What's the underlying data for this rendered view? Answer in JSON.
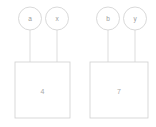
{
  "diagram": {
    "type": "node-plate-diagram",
    "background_color": "#ffffff",
    "stroke_color": "#cfcfcf",
    "text_color": "#9a9a9a",
    "groups": [
      {
        "id": "left-group",
        "nodes": [
          {
            "id": "node-a",
            "label": "a",
            "cx": 30,
            "cy": 18.5,
            "r": 11.5
          },
          {
            "id": "node-x",
            "label": "x",
            "cx": 57,
            "cy": 18.5,
            "r": 11.5
          }
        ],
        "edges": [
          {
            "id": "edge-a-box",
            "from": "node-a",
            "to": "box-4",
            "x": 30,
            "y1": 30,
            "y2": 62
          },
          {
            "id": "edge-x-box",
            "from": "node-x",
            "to": "box-4",
            "x": 57,
            "y1": 30,
            "y2": 62
          }
        ],
        "plate": {
          "id": "box-4",
          "label": "4",
          "x": 15,
          "y": 62,
          "width": 55,
          "height": 56
        }
      },
      {
        "id": "right-group",
        "nodes": [
          {
            "id": "node-b",
            "label": "b",
            "cx": 108,
            "cy": 18.5,
            "r": 11.5
          },
          {
            "id": "node-y",
            "label": "y",
            "cx": 135,
            "cy": 18.5,
            "r": 11.5
          }
        ],
        "edges": [
          {
            "id": "edge-b-box",
            "from": "node-b",
            "to": "box-7",
            "x": 108,
            "y1": 30,
            "y2": 62
          },
          {
            "id": "edge-y-box",
            "from": "node-y",
            "to": "box-7",
            "x": 135,
            "y1": 30,
            "y2": 62
          }
        ],
        "plate": {
          "id": "box-7",
          "label": "7",
          "x": 90,
          "y": 62,
          "width": 58,
          "height": 56
        }
      }
    ]
  },
  "labels": {
    "node_a": "a",
    "node_x": "x",
    "node_b": "b",
    "node_y": "y",
    "plate_left": "4",
    "plate_right": "7"
  }
}
